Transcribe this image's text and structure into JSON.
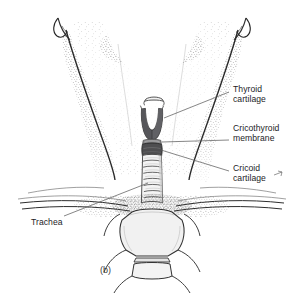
{
  "figure": {
    "caption": "(b)",
    "background_color": "#ffffff",
    "ink_color": "#2b2b2b",
    "label_color": "#1d1d1f",
    "leader_color": "#5d5d5d",
    "cartilage_fill": "#5a5a5c",
    "bone_fill": "#efefef"
  },
  "labels": {
    "thyroid_cartilage": {
      "line1": "Thyroid",
      "line2": "cartilage"
    },
    "cricothyroid_membrane": {
      "line1": "Cricothyroid",
      "line2": "membrane"
    },
    "cricoid_cartilage": {
      "line1": "Cricoid",
      "line2": "cartilage"
    },
    "trachea": {
      "line1": "Trachea"
    }
  },
  "structures": [
    {
      "name": "hyoid-bone",
      "shade": "light"
    },
    {
      "name": "thyroid-cartilage",
      "shade": "dark"
    },
    {
      "name": "cricothyroid-membrane",
      "shade": "mid"
    },
    {
      "name": "cricoid-cartilage",
      "shade": "dark"
    },
    {
      "name": "trachea",
      "shade": "light"
    },
    {
      "name": "manubrium",
      "shade": "light"
    },
    {
      "name": "clavicle-left",
      "shade": "outline"
    },
    {
      "name": "clavicle-right",
      "shade": "outline"
    },
    {
      "name": "sternocleidomastoid-left",
      "shade": "stipple"
    },
    {
      "name": "sternocleidomastoid-right",
      "shade": "stipple"
    },
    {
      "name": "mandible",
      "shade": "stipple"
    }
  ]
}
